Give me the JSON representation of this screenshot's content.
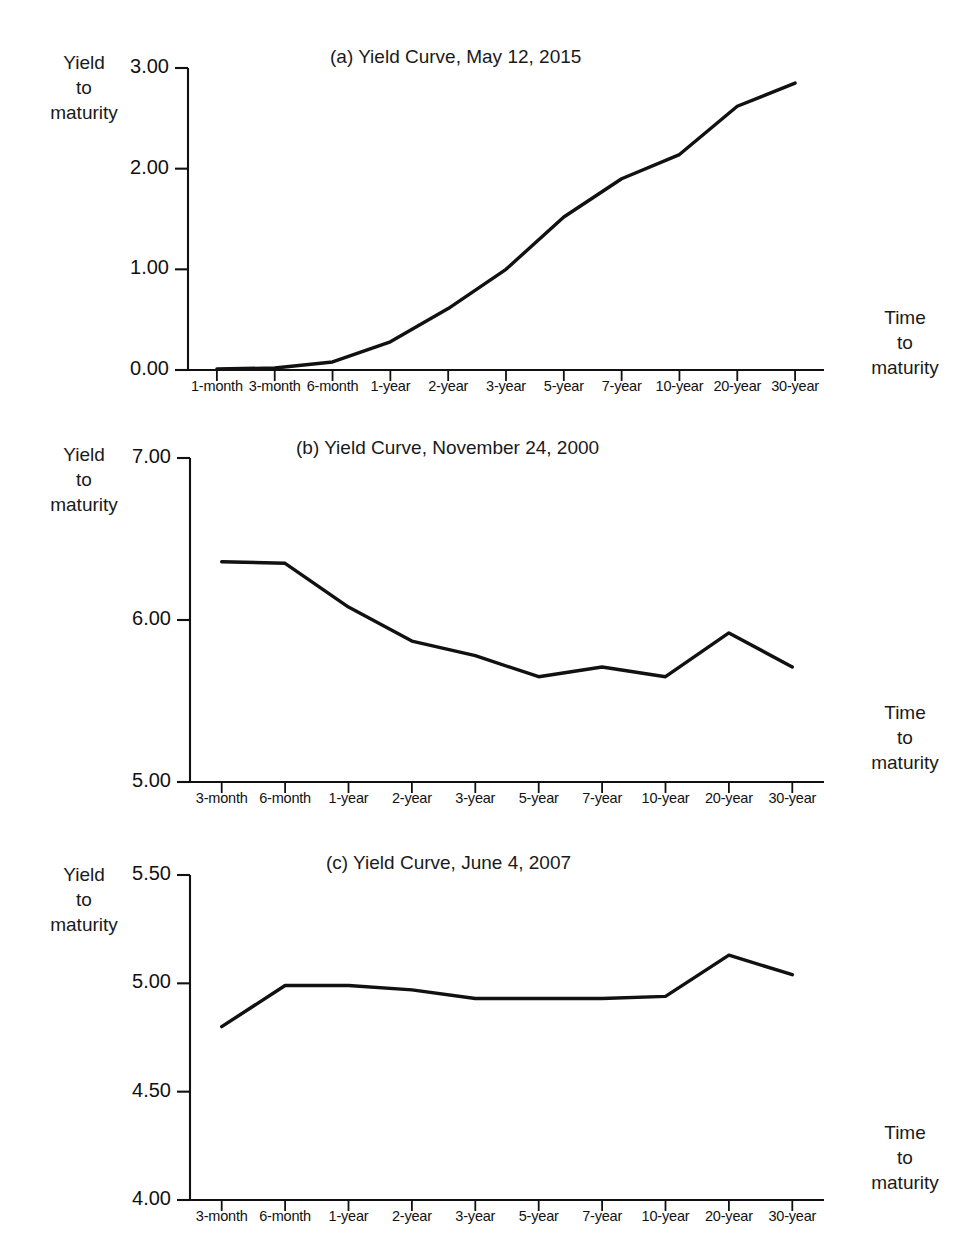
{
  "figure": {
    "axis_labels": {
      "y_line1": "Yield",
      "y_line2": "to",
      "y_line3": "maturity",
      "x_line1": "Time",
      "x_line2": "to",
      "x_line3": "maturity"
    }
  },
  "chart_data": [
    {
      "type": "line",
      "panel": "a",
      "title": "(a) Yield Curve, May 12, 2015",
      "xlabel": "Time to maturity",
      "ylabel": "Yield to maturity",
      "ylim": [
        0.0,
        3.0
      ],
      "yticks": [
        0.0,
        1.0,
        2.0,
        3.0
      ],
      "ytick_labels": [
        "0.00",
        "1.00",
        "2.00",
        "3.00"
      ],
      "grid": false,
      "legend": "none",
      "categories": [
        "1-month",
        "3-month",
        "6-month",
        "1-year",
        "2-year",
        "3-year",
        "5-year",
        "7-year",
        "10-year",
        "20-year",
        "30-year"
      ],
      "values": [
        0.01,
        0.02,
        0.08,
        0.28,
        0.61,
        1.0,
        1.52,
        1.9,
        2.14,
        2.62,
        2.85
      ]
    },
    {
      "type": "line",
      "panel": "b",
      "title": "(b) Yield Curve, November 24, 2000",
      "xlabel": "Time to maturity",
      "ylabel": "Yield to maturity",
      "ylim": [
        5.0,
        7.0
      ],
      "yticks": [
        5.0,
        6.0,
        7.0
      ],
      "ytick_labels": [
        "5.00",
        "6.00",
        "7.00"
      ],
      "grid": false,
      "legend": "none",
      "categories": [
        "3-month",
        "6-month",
        "1-year",
        "2-year",
        "3-year",
        "5-year",
        "7-year",
        "10-year",
        "20-year",
        "30-year"
      ],
      "values": [
        6.36,
        6.35,
        6.08,
        5.87,
        5.78,
        5.65,
        5.71,
        5.65,
        5.92,
        5.71
      ]
    },
    {
      "type": "line",
      "panel": "c",
      "title": "(c) Yield Curve, June 4, 2007",
      "xlabel": "Time to maturity",
      "ylabel": "Yield to maturity",
      "ylim": [
        4.0,
        5.5
      ],
      "yticks": [
        4.0,
        4.5,
        5.0,
        5.5
      ],
      "ytick_labels": [
        "4.00",
        "4.50",
        "5.00",
        "5.50"
      ],
      "grid": false,
      "legend": "none",
      "categories": [
        "3-month",
        "6-month",
        "1-year",
        "2-year",
        "3-year",
        "5-year",
        "7-year",
        "10-year",
        "20-year",
        "30-year"
      ],
      "values": [
        4.8,
        4.99,
        4.99,
        4.97,
        4.93,
        4.93,
        4.93,
        4.94,
        5.13,
        5.04
      ]
    }
  ]
}
